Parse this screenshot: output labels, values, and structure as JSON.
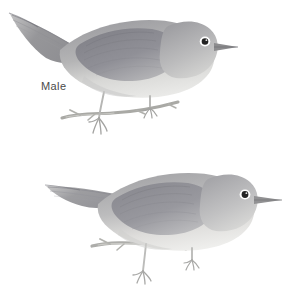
{
  "plate": {
    "background_color": "#ffffff",
    "style": "pencil-and-wash natural history illustration",
    "width": 296,
    "height": 288
  },
  "figures": [
    {
      "id": "male",
      "label": "Male",
      "label_color": "#4a4a4a",
      "subject": "perched gray warbler, facing right, long tail to upper left",
      "perch": "thin bare twig",
      "colors": {
        "upperparts": "#9a9a9e",
        "wing": "#86868c",
        "underparts": "#d7d7d6",
        "tail": "#9d9d9f",
        "eye_ring": "#ffffff",
        "eye": "#242424",
        "bill": "#8c8c8e",
        "legs": "#b6b6b4",
        "branch": "#a9a9a5"
      }
    },
    {
      "id": "female",
      "label": "Female",
      "label_color": "#4a4a4a",
      "subject": "perched gray warbler, facing right, long tail to upper left",
      "perch": "thin bare twig",
      "colors": {
        "upperparts": "#a2a2a4",
        "wing": "#8e8e93",
        "underparts": "#dcdcdb",
        "tail": "#a4a4a6",
        "eye_ring": "#ffffff",
        "eye": "#242424",
        "bill": "#919193",
        "legs": "#bcbcba",
        "branch": "#adadaa"
      }
    }
  ]
}
